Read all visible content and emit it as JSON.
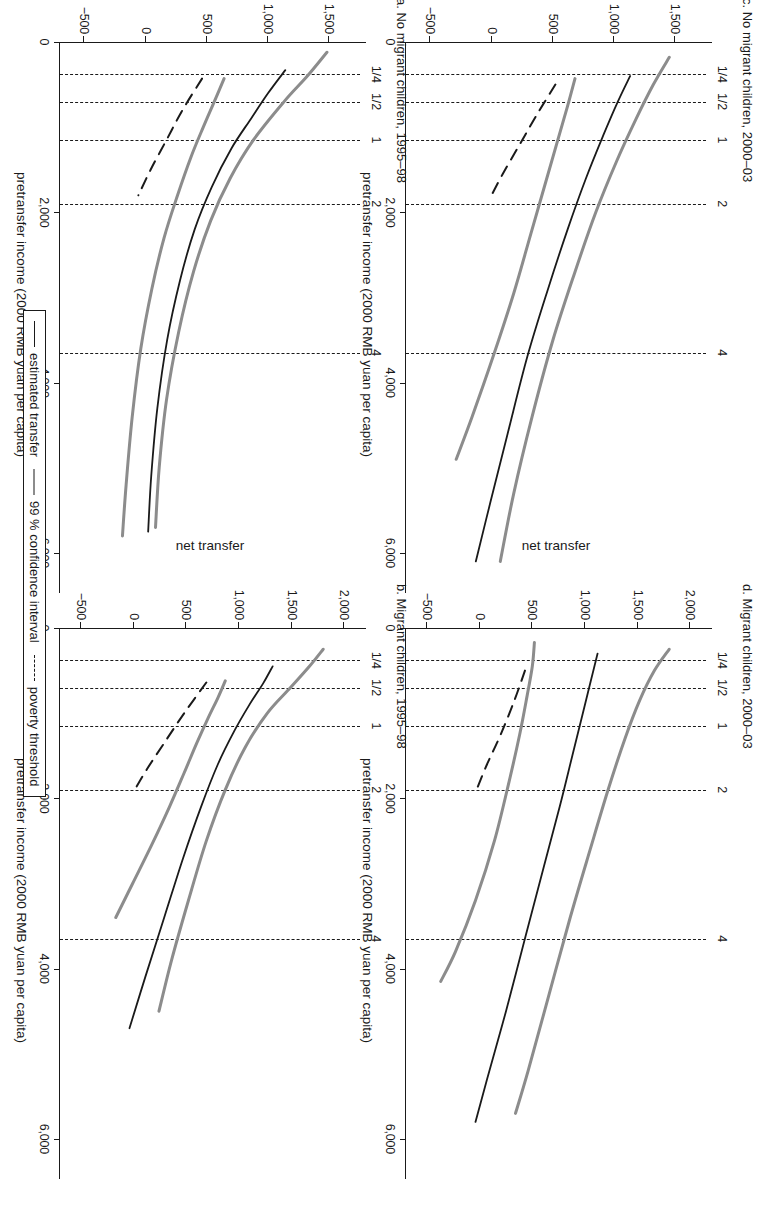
{
  "figure": {
    "axis_title_x": "pretransfer income (2000 RMB yuan per capita)",
    "axis_title_y": "net transfer"
  },
  "legend": {
    "items": [
      {
        "label": "estimated transfer",
        "style": "solid-dark"
      },
      {
        "label": "99 % confidence interval",
        "style": "solid-grey"
      },
      {
        "label": "poverty threshold",
        "style": "dashed"
      }
    ]
  },
  "panels": [
    {
      "key": "a",
      "title": "a. No migrant children, 1995–98",
      "x_ticks": [
        "0",
        "2,000",
        "4,000",
        "6,000"
      ],
      "y_ticks": [
        "1,500",
        "1,000",
        "500",
        "0",
        "−500"
      ],
      "poverty_labels": [
        "1/4",
        "1/2",
        "1",
        "2",
        "4"
      ]
    },
    {
      "key": "b",
      "title": "b. Migrant children, 1995–98",
      "x_ticks": [
        "0",
        "2,000",
        "4,000",
        "6,000"
      ],
      "y_ticks": [
        "2,000",
        "1,500",
        "1,000",
        "500",
        "0",
        "−500"
      ],
      "poverty_labels": [
        "1/4",
        "1/2",
        "1",
        "2",
        "4"
      ]
    },
    {
      "key": "c",
      "title": "c. No migrant children, 2000–03",
      "x_ticks": [
        "0",
        "2,000",
        "4,000",
        "6,000"
      ],
      "y_ticks": [
        "1,500",
        "1,000",
        "500",
        "0",
        "−500"
      ],
      "poverty_labels": [
        "1/4",
        "1/2",
        "1",
        "2",
        "4"
      ]
    },
    {
      "key": "d",
      "title": "d. Migrant children, 2000–03",
      "x_ticks": [
        "0",
        "2,000",
        "4,000",
        "6,000"
      ],
      "y_ticks": [
        "2,000",
        "1,500",
        "1,000",
        "500",
        "0",
        "−500"
      ],
      "poverty_labels": [
        "1/4",
        "1/2",
        "1",
        "2",
        "4"
      ]
    }
  ],
  "chart_data": {
    "type": "line",
    "layout": "2x2 small-multiples, figure rotated 90 degrees clockwise in page",
    "shared": {
      "xlabel": "pretransfer income (2000 RMB yuan per capita)",
      "ylabel": "net transfer",
      "xlim": [
        0,
        6400
      ],
      "xticks": [
        0,
        2000,
        4000,
        6000
      ],
      "grid": false,
      "legend_position": "bottom",
      "legend_entries": [
        "estimated transfer",
        "99 % confidence interval",
        "poverty threshold"
      ],
      "poverty_threshold_lines_x": [
        380,
        700,
        1150,
        1900,
        3650
      ],
      "poverty_threshold_labels": [
        "1/4",
        "1/2",
        "1",
        "2",
        "4"
      ],
      "colors": {
        "estimate": "#1a1a1a",
        "confidence": "#8c8c8c",
        "threshold": "#1a1a1a"
      }
    },
    "panels": [
      {
        "key": "a",
        "title": "a. No migrant children, 1995–98",
        "ylim": [
          -700,
          1750
        ],
        "yticks": [
          1500,
          1000,
          500,
          0,
          -500
        ],
        "series": [
          {
            "name": "upper 99 % confidence bound",
            "style": "solid-grey",
            "x": [
              120,
              400,
              700,
              1150,
              1600,
              2100,
              2700,
              3400,
              4200,
              5000,
              5700
            ],
            "y": [
              1480,
              1320,
              1130,
              880,
              690,
              530,
              390,
              270,
              170,
              110,
              80
            ]
          },
          {
            "name": "estimated transfer",
            "style": "solid-dark",
            "x": [
              330,
              600,
              900,
              1250,
              1700,
              2200,
              2800,
              3500,
              4300,
              5100,
              5750
            ],
            "y": [
              1140,
              1000,
              860,
              700,
              540,
              400,
              280,
              175,
              95,
              45,
              20
            ]
          },
          {
            "name": "lower 99 % confidence bound",
            "style": "solid-grey",
            "x": [
              430,
              700,
              1000,
              1350,
              1800,
              2300,
              2900,
              3600,
              4400,
              5200,
              5800
            ],
            "y": [
              640,
              560,
              470,
              370,
              260,
              150,
              50,
              -40,
              -110,
              -160,
              -190
            ]
          },
          {
            "name": "poverty threshold",
            "style": "dashed",
            "x": [
              430,
              800,
              1150,
              1500,
              1800
            ],
            "y": [
              460,
              300,
              170,
              40,
              -60
            ]
          }
        ]
      },
      {
        "key": "b",
        "title": "b. Migrant children, 1995–98",
        "ylim": [
          -700,
          2150
        ],
        "yticks": [
          2000,
          1500,
          1000,
          500,
          0,
          -500
        ],
        "series": [
          {
            "name": "upper 99 % confidence bound",
            "style": "solid-grey",
            "x": [
              250,
              450,
              700,
              1000,
              1400,
              1900,
              2500,
              3200,
              3900,
              4500
            ],
            "y": [
              1800,
              1670,
              1490,
              1270,
              1060,
              870,
              690,
              520,
              360,
              240
            ]
          },
          {
            "name": "estimated transfer",
            "style": "solid-dark",
            "x": [
              450,
              650,
              900,
              1200,
              1600,
              2100,
              2700,
              3400,
              4100,
              4700
            ],
            "y": [
              1320,
              1230,
              1100,
              960,
              800,
              640,
              470,
              290,
              110,
              -40
            ]
          },
          {
            "name": "lower 99 % confidence bound",
            "style": "solid-grey",
            "x": [
              620,
              820,
              1050,
              1350,
              1700,
              2100,
              2550,
              3000,
              3400
            ],
            "y": [
              870,
              800,
              710,
              600,
              480,
              340,
              170,
              -10,
              -170
            ]
          },
          {
            "name": "poverty threshold",
            "style": "dashed",
            "x": [
              640,
              1000,
              1350,
              1650,
              1900
            ],
            "y": [
              690,
              480,
              290,
              130,
              10
            ]
          }
        ]
      },
      {
        "key": "c",
        "title": "c. No migrant children, 2000–03",
        "ylim": [
          -700,
          1750
        ],
        "yticks": [
          1500,
          1000,
          500,
          0,
          -500
        ],
        "series": [
          {
            "name": "upper 99 % confidence bound",
            "style": "solid-grey",
            "x": [
              180,
              500,
              900,
              1400,
              2000,
              2700,
              3500,
              4400,
              5300,
              6100
            ],
            "y": [
              1450,
              1320,
              1180,
              1020,
              850,
              680,
              500,
              330,
              180,
              70
            ]
          },
          {
            "name": "estimated transfer",
            "style": "solid-dark",
            "x": [
              400,
              700,
              1100,
              1600,
              2200,
              2900,
              3700,
              4600,
              5400,
              6100
            ],
            "y": [
              1130,
              1030,
              910,
              770,
              620,
              460,
              290,
              130,
              -10,
              -130
            ]
          },
          {
            "name": "lower 99 % confidence bound",
            "style": "solid-grey",
            "x": [
              430,
              750,
              1150,
              1650,
              2250,
              2950,
              3700,
              4400,
              4900
            ],
            "y": [
              680,
              620,
              540,
              440,
              320,
              180,
              10,
              -160,
              -290
            ]
          },
          {
            "name": "poverty threshold",
            "style": "dashed",
            "x": [
              500,
              850,
              1200,
              1550,
              1850
            ],
            "y": [
              520,
              370,
              230,
              90,
              -20
            ]
          }
        ]
      },
      {
        "key": "d",
        "title": "d. Migrant children, 2000–03",
        "ylim": [
          -700,
          2150
        ],
        "yticks": [
          2000,
          1500,
          1000,
          500,
          0,
          -500
        ],
        "series": [
          {
            "name": "upper 99 % confidence bound",
            "style": "solid-grey",
            "x": [
              250,
              500,
              850,
              1300,
              1900,
              2600,
              3400,
              4300,
              5200,
              5700
            ],
            "y": [
              1800,
              1660,
              1520,
              1380,
              1220,
              1050,
              860,
              660,
              460,
              340
            ]
          },
          {
            "name": "estimated transfer",
            "style": "solid-dark",
            "x": [
              300,
              600,
              1000,
              1500,
              2100,
              2800,
              3600,
              4500,
              5300,
              5800
            ],
            "y": [
              1120,
              1060,
              980,
              880,
              760,
              610,
              440,
              250,
              70,
              -40
            ]
          },
          {
            "name": "lower 99 % confidence bound",
            "style": "solid-grey",
            "x": [
              170,
              450,
              800,
              1250,
              1800,
              2500,
              3200,
              3800,
              4150
            ],
            "y": [
              520,
              500,
              450,
              380,
              280,
              140,
              -40,
              -230,
              -370
            ]
          },
          {
            "name": "poverty threshold",
            "style": "dashed",
            "x": [
              500,
              850,
              1250,
              1600,
              1900
            ],
            "y": [
              430,
              330,
              200,
              70,
              -30
            ]
          }
        ]
      }
    ]
  }
}
